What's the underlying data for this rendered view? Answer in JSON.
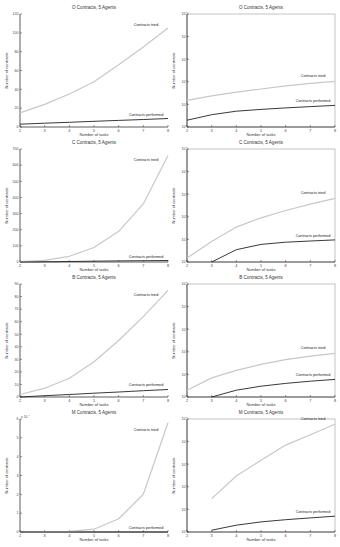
{
  "chart_data": [
    {
      "type": "line",
      "id": "O-linear",
      "title": "O Contracts, 5 Agents",
      "xlabel": "Number of tasks",
      "ylabel": "Number of contracts",
      "yscale": "linear",
      "xlim": [
        2,
        8
      ],
      "ylim": [
        0,
        120
      ],
      "xticks": [
        2,
        3,
        4,
        5,
        6,
        7,
        8
      ],
      "yticks": [
        0,
        20,
        40,
        60,
        80,
        100,
        120
      ],
      "x": [
        2,
        3,
        4,
        5,
        6,
        7,
        8
      ],
      "series": [
        {
          "name": "Contracts tried",
          "values": [
            15,
            24,
            35,
            48,
            66,
            85,
            105
          ]
        },
        {
          "name": "Contracts performed",
          "values": [
            3,
            4,
            5,
            6,
            7,
            8,
            9
          ]
        }
      ],
      "annotations": [
        "Contracts tried",
        "Contracts performed"
      ]
    },
    {
      "type": "line",
      "id": "O-log",
      "title": "O Contracts, 5 Agents",
      "xlabel": "Number of tasks",
      "ylabel": "Number of contracts",
      "yscale": "log",
      "xlim": [
        2,
        8
      ],
      "ylim": [
        1,
        100000
      ],
      "xticks": [
        2,
        3,
        4,
        5,
        6,
        7,
        8
      ],
      "yticks": [
        "10^0",
        "10^1",
        "10^2",
        "10^3",
        "10^4",
        "10^5"
      ],
      "x": [
        2,
        3,
        4,
        5,
        6,
        7,
        8
      ],
      "series": [
        {
          "name": "Contracts tried",
          "values": [
            15,
            24,
            35,
            48,
            66,
            85,
            105
          ]
        },
        {
          "name": "Contracts performed",
          "values": [
            2,
            3.5,
            5,
            6,
            7,
            8,
            9
          ]
        }
      ],
      "annotations": [
        "Contracts tried",
        "Contracts performed"
      ]
    },
    {
      "type": "line",
      "id": "C-linear",
      "title": "C Contracts, 5 Agents",
      "xlabel": "Number of tasks",
      "ylabel": "Number of contracts",
      "yscale": "linear",
      "xlim": [
        2,
        8
      ],
      "ylim": [
        0,
        700
      ],
      "xticks": [
        2,
        3,
        4,
        5,
        6,
        7,
        8
      ],
      "yticks": [
        0,
        100,
        200,
        300,
        400,
        500,
        600,
        700
      ],
      "x": [
        2,
        3,
        4,
        5,
        6,
        7,
        8
      ],
      "series": [
        {
          "name": "Contracts tried",
          "values": [
            2,
            10,
            35,
            90,
            190,
            360,
            660
          ]
        },
        {
          "name": "Contracts performed",
          "values": [
            0,
            1,
            3,
            5,
            7,
            8,
            9
          ]
        }
      ],
      "annotations": [
        "Contracts tried",
        "Contracts performed"
      ]
    },
    {
      "type": "line",
      "id": "C-log",
      "title": "C Contracts, 5 Agents",
      "xlabel": "Number of tasks",
      "ylabel": "Number of contracts",
      "yscale": "log",
      "xlim": [
        2,
        8
      ],
      "ylim": [
        1,
        100000
      ],
      "xticks": [
        2,
        3,
        4,
        5,
        6,
        7,
        8
      ],
      "yticks": [
        "10^0",
        "10^1",
        "10^2",
        "10^3",
        "10^4",
        "10^5"
      ],
      "x": [
        2,
        3,
        4,
        5,
        6,
        7,
        8
      ],
      "series": [
        {
          "name": "Contracts tried",
          "values": [
            1.5,
            8,
            35,
            90,
            190,
            360,
            660
          ]
        },
        {
          "name": "Contracts performed",
          "values": [
            null,
            1,
            3.5,
            6,
            7.5,
            8.5,
            9.5
          ]
        }
      ],
      "annotations": [
        "Contracts tried",
        "Contracts performed"
      ]
    },
    {
      "type": "line",
      "id": "B-linear",
      "title": "B Contracts, 5 Agents",
      "xlabel": "Number of tasks",
      "ylabel": "Number of contracts",
      "yscale": "linear",
      "xlim": [
        2,
        8
      ],
      "ylim": [
        0,
        90
      ],
      "xticks": [
        2,
        3,
        4,
        5,
        6,
        7,
        8
      ],
      "yticks": [
        0,
        10,
        20,
        30,
        40,
        50,
        60,
        70,
        80,
        90
      ],
      "x": [
        2,
        3,
        4,
        5,
        6,
        7,
        8
      ],
      "series": [
        {
          "name": "Contracts tried",
          "values": [
            2,
            7,
            15,
            28,
            45,
            64,
            85
          ]
        },
        {
          "name": "Contracts performed",
          "values": [
            0,
            1,
            2,
            3,
            4,
            5,
            6
          ]
        }
      ],
      "annotations": [
        "Contracts tried",
        "Contracts performed"
      ]
    },
    {
      "type": "line",
      "id": "B-log",
      "title": "B Contracts, 5 Agents",
      "xlabel": "Number of tasks",
      "ylabel": "Number of contracts",
      "yscale": "log",
      "xlim": [
        2,
        8
      ],
      "ylim": [
        1,
        100000
      ],
      "xticks": [
        2,
        3,
        4,
        5,
        6,
        7,
        8
      ],
      "yticks": [
        "10^0",
        "10^1",
        "10^2",
        "10^3",
        "10^4",
        "10^5"
      ],
      "x": [
        2,
        3,
        4,
        5,
        6,
        7,
        8
      ],
      "series": [
        {
          "name": "Contracts tried",
          "values": [
            2,
            7,
            15,
            28,
            45,
            64,
            85
          ]
        },
        {
          "name": "Contracts performed",
          "values": [
            null,
            1,
            2,
            3,
            4,
            5,
            6
          ]
        }
      ],
      "annotations": [
        "Contracts tried",
        "Contracts performed"
      ]
    },
    {
      "type": "line",
      "id": "M-linear",
      "title": "M Contracts, 5 Agents",
      "xlabel": "Number of tasks",
      "ylabel": "Number of contracts",
      "yscale": "linear",
      "xlim": [
        2,
        8
      ],
      "ylim": [
        0,
        60000
      ],
      "y_multiplier": "x 10^4",
      "xticks": [
        2,
        3,
        4,
        5,
        6,
        7,
        8
      ],
      "yticks": [
        0,
        1,
        2,
        3,
        4,
        5,
        6
      ],
      "x": [
        2,
        3,
        4,
        5,
        6,
        7,
        8
      ],
      "series": [
        {
          "name": "Contracts tried",
          "values": [
            3,
            30,
            300,
            1500,
            7000,
            20000,
            58000
          ]
        },
        {
          "name": "Contracts performed",
          "values": [
            0,
            1,
            2,
            3,
            4,
            5,
            5
          ]
        }
      ],
      "annotations": [
        "Contracts tried",
        "Contracts performed"
      ]
    },
    {
      "type": "line",
      "id": "M-log",
      "title": "M Contracts, 5 Agents",
      "xlabel": "Number of tasks",
      "ylabel": "Number of contracts",
      "yscale": "log",
      "xlim": [
        2,
        8
      ],
      "ylim": [
        1,
        100000
      ],
      "xticks": [
        2,
        3,
        4,
        5,
        6,
        7,
        8
      ],
      "yticks": [
        "10^0",
        "10^1",
        "10^2",
        "10^3",
        "10^4",
        "10^5"
      ],
      "x": [
        2,
        3,
        4,
        5,
        6,
        7,
        8
      ],
      "series": [
        {
          "name": "Contracts tried",
          "values": [
            null,
            30,
            300,
            1500,
            7000,
            20000,
            58000
          ]
        },
        {
          "name": "Contracts performed",
          "values": [
            null,
            1.2,
            2,
            2.8,
            3.5,
            4.2,
            5
          ]
        }
      ],
      "annotations": [
        "Contracts tried",
        "Contracts performed"
      ]
    }
  ],
  "colors": {
    "tried": "#c8c8c8",
    "performed": "#222222",
    "axis": "#333333"
  }
}
